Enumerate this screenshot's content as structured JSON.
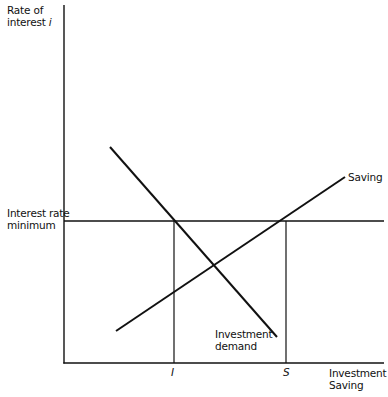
{
  "diagram": {
    "type": "economics-line-diagram",
    "y_axis": {
      "label_line1": "Rate of",
      "label_line2": "interest i"
    },
    "x_axis": {
      "label_line1": "Investment",
      "label_line2": "Saving"
    },
    "horizontal_line": {
      "label_line1": "Interest rate",
      "label_line2": "minimum"
    },
    "curves": [
      {
        "name": "Saving",
        "label": "Saving",
        "slope": "upward"
      },
      {
        "name": "Investment demand",
        "label_line1": "Investment",
        "label_line2": "demand",
        "slope": "downward"
      }
    ],
    "x_ticks": [
      {
        "label": "I",
        "meaning": "investment at interest rate minimum"
      },
      {
        "label": "S",
        "meaning": "saving at interest rate minimum"
      }
    ],
    "colors": {
      "ink": "#111111",
      "background": "#ffffff"
    }
  },
  "chart_data": {
    "type": "line",
    "title": "",
    "xlabel": "Investment / Saving",
    "ylabel": "Rate of interest i",
    "series": [
      {
        "name": "Saving",
        "points": [
          [
            0.16,
            0.09
          ],
          [
            0.88,
            0.52
          ]
        ]
      },
      {
        "name": "Investment demand",
        "points": [
          [
            0.14,
            0.6
          ],
          [
            0.67,
            0.07
          ]
        ]
      },
      {
        "name": "Interest rate minimum",
        "points": [
          [
            0.0,
            0.4
          ],
          [
            1.0,
            0.4
          ]
        ]
      }
    ],
    "x_ticks": [
      "I",
      "S"
    ],
    "annotations": [
      "Interest rate minimum",
      "Saving",
      "Investment demand"
    ],
    "grid": false
  }
}
